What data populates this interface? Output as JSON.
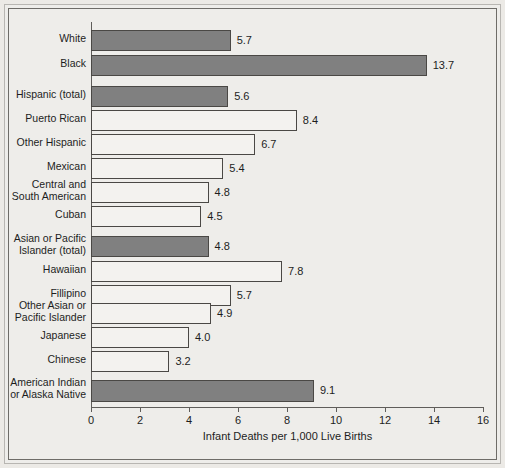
{
  "chart_data": {
    "type": "bar",
    "orientation": "horizontal",
    "title": "",
    "xlabel": "Infant Deaths per 1,000 Live Births",
    "ylabel": "",
    "xlim": [
      0,
      16
    ],
    "xticks": [
      0,
      2,
      4,
      6,
      8,
      10,
      12,
      14,
      16
    ],
    "grid": false,
    "legend": "none",
    "colors": {
      "highlight_bar": "#808080",
      "standard_bar": "#f3f2ef",
      "bar_outline": "#4a4845",
      "background": "#eeedea",
      "text": "#1d1d1d"
    },
    "categories": [
      "White",
      "Black",
      "Hispanic (total)",
      "Puerto Rican",
      "Other Hispanic",
      "Mexican",
      "Central and\nSouth American",
      "Cuban",
      "Asian or Pacific\nIslander (total)",
      "Hawaiian",
      "Fillipino",
      "Other Asian or\nPacific Islander",
      "Japanese",
      "Chinese",
      "American Indian\nor Alaska Native"
    ],
    "values": [
      5.7,
      13.7,
      5.6,
      8.4,
      6.7,
      5.4,
      4.8,
      4.5,
      4.8,
      7.8,
      5.7,
      4.9,
      4.0,
      3.2,
      9.1
    ],
    "value_labels": [
      "5.7",
      "13.7",
      "5.6",
      "8.4",
      "6.7",
      "5.4",
      "4.8",
      "4.5",
      "4.8",
      "7.8",
      "5.7",
      "4.9",
      "4.0",
      "3.2",
      "9.1"
    ],
    "emphasis": [
      true,
      true,
      true,
      false,
      false,
      false,
      false,
      false,
      true,
      false,
      false,
      false,
      false,
      false,
      true
    ]
  },
  "bars": [
    {
      "label": "White",
      "value_label": "5.7",
      "value": 5.7,
      "style": "dark",
      "top": 30,
      "height": 21,
      "label_top": 33,
      "label_lines": 1
    },
    {
      "label": "Black",
      "value_label": "13.7",
      "value": 13.7,
      "style": "dark",
      "top": 55,
      "height": 21,
      "label_top": 58,
      "label_lines": 1
    },
    {
      "label": "Hispanic (total)",
      "value_label": "5.6",
      "value": 5.6,
      "style": "dark",
      "top": 86,
      "height": 21,
      "label_top": 89,
      "label_lines": 1
    },
    {
      "label": "Puerto Rican",
      "value_label": "8.4",
      "value": 8.4,
      "style": "light",
      "top": 110,
      "height": 21,
      "label_top": 113,
      "label_lines": 1
    },
    {
      "label": "Other Hispanic",
      "value_label": "6.7",
      "value": 6.7,
      "style": "light",
      "top": 134,
      "height": 21,
      "label_top": 137,
      "label_lines": 1
    },
    {
      "label": "Mexican",
      "value_label": "5.4",
      "value": 5.4,
      "style": "light",
      "top": 158,
      "height": 21,
      "label_top": 161,
      "label_lines": 1
    },
    {
      "label": "Central and\nSouth American",
      "value_label": "4.8",
      "value": 4.8,
      "style": "light",
      "top": 182,
      "height": 21,
      "label_top": 179,
      "label_lines": 2
    },
    {
      "label": "Cuban",
      "value_label": "4.5",
      "value": 4.5,
      "style": "light",
      "top": 206,
      "height": 21,
      "label_top": 209,
      "label_lines": 1
    },
    {
      "label": "Asian or Pacific\nIslander (total)",
      "value_label": "4.8",
      "value": 4.8,
      "style": "dark",
      "top": 236,
      "height": 21,
      "label_top": 233,
      "label_lines": 2
    },
    {
      "label": "Hawaiian",
      "value_label": "7.8",
      "value": 7.8,
      "style": "light",
      "top": 261,
      "height": 21,
      "label_top": 264,
      "label_lines": 1
    },
    {
      "label": "Fillipino",
      "value_label": "5.7",
      "value": 5.7,
      "style": "light",
      "top": 285,
      "height": 21,
      "label_top": 288,
      "label_lines": 1
    },
    {
      "label": "Other Asian or\nPacific Islander",
      "value_label": "4.9",
      "value": 4.9,
      "style": "light",
      "top": 303,
      "height": 21,
      "label_top": 300,
      "label_lines": 2
    },
    {
      "label": "Japanese",
      "value_label": "4.0",
      "value": 4.0,
      "style": "light",
      "top": 327,
      "height": 21,
      "label_top": 330,
      "label_lines": 1
    },
    {
      "label": "Chinese",
      "value_label": "3.2",
      "value": 3.2,
      "style": "light",
      "top": 351,
      "height": 21,
      "label_top": 354,
      "label_lines": 1
    },
    {
      "label": "American Indian\nor Alaska Native",
      "value_label": "9.1",
      "value": 9.1,
      "style": "dark",
      "top": 380,
      "height": 22,
      "label_top": 377,
      "label_lines": 2
    }
  ],
  "axis": {
    "title": "Infant Deaths per 1,000 Live Births",
    "ticks": [
      {
        "value": 0,
        "label": "0"
      },
      {
        "value": 2,
        "label": "2"
      },
      {
        "value": 4,
        "label": "4"
      },
      {
        "value": 6,
        "label": "6"
      },
      {
        "value": 8,
        "label": "8"
      },
      {
        "value": 10,
        "label": "10"
      },
      {
        "value": 12,
        "label": "12"
      },
      {
        "value": 14,
        "label": "14"
      },
      {
        "value": 16,
        "label": "16"
      }
    ]
  }
}
